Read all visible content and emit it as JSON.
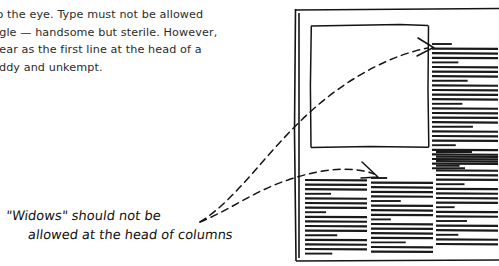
{
  "background_color": "#ffffff",
  "ink_color": "#141414",
  "printed_text": {
    "note": "body copy clipped by the left edge of the screenshot",
    "lines": [
      "to the eye. Type must not be allowed",
      "ngle — handsome but sterile. However,",
      "pear as the first line at the head of a",
      "oddy and unkempt."
    ]
  },
  "handwritten_note": {
    "lines": [
      "\"Widows\" should not be",
      "allowed at the head of columns"
    ],
    "full_text": "\"Widows\" should not be allowed at the head of columns"
  },
  "diagram": {
    "page_sheet": {
      "x": 294,
      "y": 8,
      "width": 205,
      "height": 254
    },
    "image_placeholder": {
      "x": 311,
      "y": 25,
      "width": 117,
      "height": 122
    },
    "annotation_arrows": [
      {
        "name": "arrow-to-top-widow",
        "target": "first short line at head of upper right column",
        "tail": [
          200,
          222
        ],
        "head": [
          432,
          48
        ]
      },
      {
        "name": "arrow-to-bottom-widow",
        "target": "first short line at head of lower middle column",
        "tail": [
          200,
          222
        ],
        "head": [
          377,
          176
        ]
      }
    ],
    "columns": [
      {
        "name": "upper-right-column",
        "x": 432,
        "y": 44,
        "width": 66,
        "widow_at_head": true,
        "line_widths": [
          0.3,
          1.0,
          1.0,
          1.0,
          0.4,
          1.0,
          1.0,
          1.0,
          0.54,
          1.0,
          1.0,
          1.0,
          1.0,
          0.46,
          1.0,
          1.0,
          1.0,
          1.0,
          0.62,
          1.0,
          1.0,
          1.0,
          0.36,
          1.0,
          1.0,
          1.0,
          1.0,
          0.5
        ]
      },
      {
        "name": "lower-left-column",
        "x": 305,
        "y": 180,
        "width": 62,
        "widow_at_head": false,
        "line_widths": [
          1.0,
          1.0,
          1.0,
          0.42,
          1.0,
          1.0,
          1.0,
          0.34,
          1.0,
          1.0,
          1.0,
          1.0,
          0.52,
          1.0,
          1.0,
          1.0,
          0.44
        ]
      },
      {
        "name": "lower-middle-column",
        "x": 371,
        "y": 178,
        "width": 62,
        "widow_at_head": true,
        "line_widths": [
          0.26,
          1.0,
          1.0,
          1.0,
          1.0,
          0.48,
          1.0,
          1.0,
          1.0,
          0.32,
          1.0,
          1.0,
          1.0,
          1.0,
          0.56,
          1.0,
          1.0
        ]
      },
      {
        "name": "lower-right-column",
        "x": 436,
        "y": 152,
        "width": 62,
        "widow_at_head": false,
        "line_widths": [
          0.58,
          1.0,
          1.0,
          0.38,
          1.0,
          1.0,
          1.0,
          0.46,
          1.0,
          1.0,
          1.0,
          1.0,
          0.3,
          1.0,
          1.0,
          0.5,
          1.0,
          1.0,
          0.36,
          1.0,
          1.0
        ]
      }
    ]
  }
}
